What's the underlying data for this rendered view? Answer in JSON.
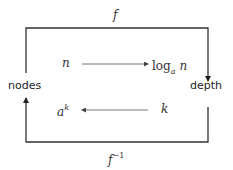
{
  "diagram": {
    "type": "mapping",
    "top_label": "f",
    "bottom_label": "f",
    "bottom_label_sup": "−1",
    "left_node": "nodes",
    "right_node": "depth",
    "forward": {
      "from": "n",
      "to_base": "log",
      "to_sub": "a",
      "to_arg": "n"
    },
    "inverse": {
      "from": "k",
      "to_base": "a",
      "to_sup": "k"
    },
    "colors": {
      "line": "#333333",
      "inner_arrow": "#555555",
      "text": "#333333"
    }
  }
}
